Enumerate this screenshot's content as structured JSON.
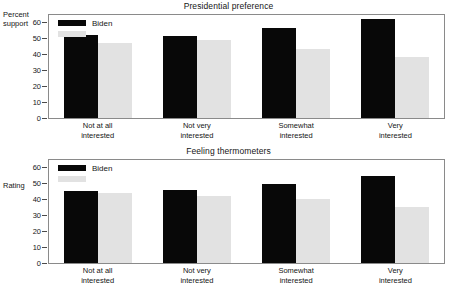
{
  "chart_data": [
    {
      "type": "bar",
      "title": "Presidential preference",
      "ylabel": "Percent\nsupport",
      "xlabel": "",
      "categories": [
        "Not at all\ninterested",
        "Not very\ninterested",
        "Somewhat\ninterested",
        "Very\ninterested"
      ],
      "series": [
        {
          "name": "Biden",
          "color": "#080808",
          "values": [
            52,
            51,
            56,
            62
          ]
        },
        {
          "name": "",
          "color": "#e2e2e2",
          "values": [
            47,
            48.5,
            43,
            38
          ]
        }
      ],
      "ylim": [
        0,
        65
      ],
      "yticks": [
        0,
        10,
        20,
        30,
        40,
        50,
        60
      ],
      "grid": false,
      "legend_position": "top-left"
    },
    {
      "type": "bar",
      "title": "Feeling thermometers",
      "ylabel": "Rating",
      "xlabel": "",
      "categories": [
        "Not at all\ninterested",
        "Not very\ninterested",
        "Somewhat\ninterested",
        "Very\ninterested"
      ],
      "series": [
        {
          "name": "Biden",
          "color": "#080808",
          "values": [
            45,
            45.5,
            49.5,
            54.5
          ]
        },
        {
          "name": "",
          "color": "#e2e2e2",
          "values": [
            44,
            42,
            40,
            35
          ]
        }
      ],
      "ylim": [
        0,
        65
      ],
      "yticks": [
        0,
        10,
        20,
        30,
        40,
        50,
        60
      ],
      "grid": false,
      "legend_position": "top-left"
    }
  ]
}
